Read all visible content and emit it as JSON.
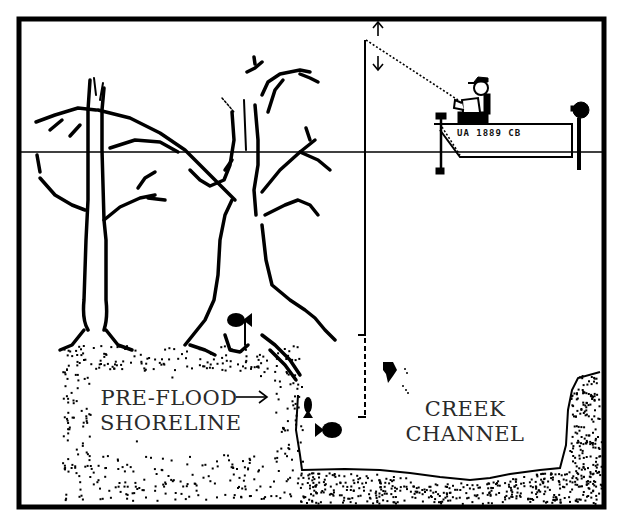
{
  "diagram": {
    "type": "cross-section illustration",
    "labels": {
      "shoreline_line1": "PRE-FLOOD",
      "shoreline_line2": "SHORELINE",
      "channel_line1": "CREEK",
      "channel_line2": "CHANNEL"
    },
    "boat": {
      "registration": "UA 1889 CB"
    },
    "elements": [
      "frame-border",
      "water-surface-line",
      "left-dead-tree",
      "center-dead-tree",
      "boat-with-angler",
      "fishing-line-vertical",
      "depth-arrows",
      "pre-flood-shoreline-bank",
      "creek-channel-bed",
      "fish-x4"
    ],
    "colors": {
      "ink": "#000000",
      "paper": "#ffffff",
      "label_text": "#2a2a2a"
    }
  }
}
